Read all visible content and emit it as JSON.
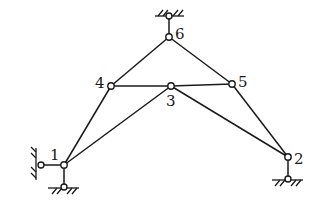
{
  "diagram": {
    "type": "truss-structure",
    "nodes": [
      {
        "id": "1",
        "label": "1",
        "x": 64,
        "y": 165
      },
      {
        "id": "2",
        "label": "2",
        "x": 288,
        "y": 157
      },
      {
        "id": "3",
        "label": "3",
        "x": 171,
        "y": 86
      },
      {
        "id": "4",
        "label": "4",
        "x": 111,
        "y": 86
      },
      {
        "id": "5",
        "label": "5",
        "x": 232,
        "y": 84
      },
      {
        "id": "6",
        "label": "6",
        "x": 169,
        "y": 37
      }
    ],
    "members": [
      [
        "1",
        "4"
      ],
      [
        "1",
        "3"
      ],
      [
        "4",
        "3"
      ],
      [
        "3",
        "5"
      ],
      [
        "4",
        "6"
      ],
      [
        "6",
        "5"
      ],
      [
        "3",
        "2"
      ],
      [
        "5",
        "2"
      ]
    ],
    "supports": [
      {
        "node": "6",
        "type": "link-top"
      },
      {
        "node": "1",
        "type": "link-left"
      },
      {
        "node": "1",
        "type": "link-bottom"
      },
      {
        "node": "2",
        "type": "link-bottom"
      }
    ],
    "labels": {
      "n1": "1",
      "n2": "2",
      "n3": "3",
      "n4": "4",
      "n5": "5",
      "n6": "6"
    }
  }
}
